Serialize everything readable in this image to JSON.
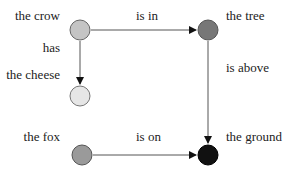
{
  "nodes": [
    {
      "id": "crow",
      "label": "the crow",
      "fill": "#c4c4c4"
    },
    {
      "id": "tree",
      "label": "the tree",
      "fill": "#777777"
    },
    {
      "id": "cheese",
      "label": "the cheese",
      "fill": "#e6e6e6"
    },
    {
      "id": "fox",
      "label": "the fox",
      "fill": "#9a9a9a"
    },
    {
      "id": "ground",
      "label": "the ground",
      "fill": "#111111"
    }
  ],
  "edges": [
    {
      "from": "crow",
      "to": "tree",
      "label": "is in"
    },
    {
      "from": "crow",
      "to": "cheese",
      "label": "has"
    },
    {
      "from": "tree",
      "to": "ground",
      "label": "is above"
    },
    {
      "from": "fox",
      "to": "ground",
      "label": "is on"
    }
  ]
}
